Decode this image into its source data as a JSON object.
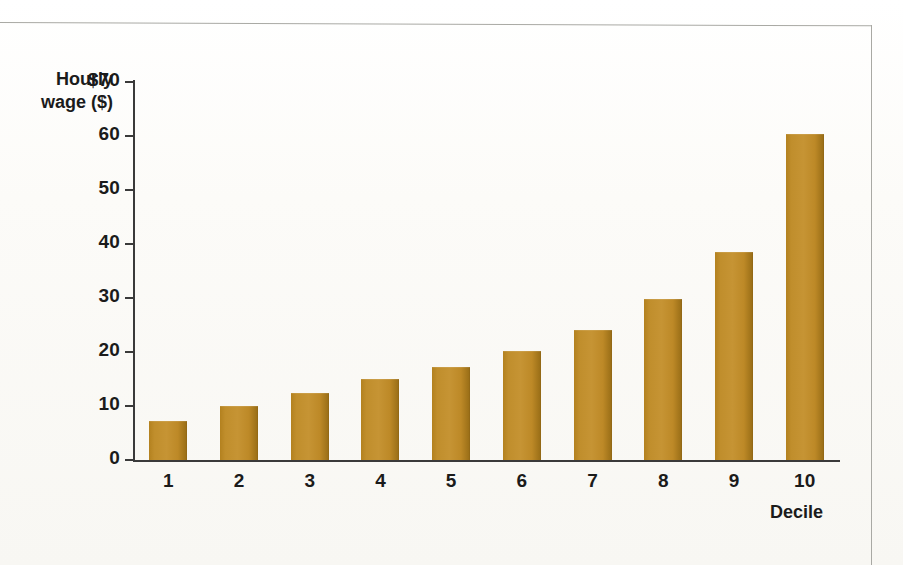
{
  "figure": {
    "background_color": "#fdfdfb",
    "frame_color": "#a9a9a4",
    "axis_color": "#3a3a3a",
    "bar_color": "#c69434",
    "bar_edge_color": "#8c6314"
  },
  "chart_data": {
    "type": "bar",
    "title": "",
    "xlabel": "Decile",
    "ylabel": "Hourly wage ($)",
    "ylabel_line1": "Hourly",
    "ylabel_line2": "wage ($)",
    "categories": [
      "1",
      "2",
      "3",
      "4",
      "5",
      "6",
      "7",
      "8",
      "9",
      "10"
    ],
    "values": [
      7.2,
      10.0,
      12.5,
      15.0,
      17.3,
      20.1,
      24.0,
      29.8,
      38.6,
      60.3
    ],
    "ylim": [
      0,
      70
    ],
    "ytick_values": [
      0,
      10,
      20,
      30,
      40,
      50,
      60,
      70
    ],
    "ytick_labels": [
      "0",
      "10",
      "20",
      "30",
      "40",
      "50",
      "60",
      "$70"
    ],
    "xtick_labels": [
      "1",
      "2",
      "3",
      "4",
      "5",
      "6",
      "7",
      "8",
      "9",
      "10"
    ],
    "grid": false,
    "legend": null,
    "series": [
      {
        "name": "Hourly wage",
        "values": [
          7.2,
          10.0,
          12.5,
          15.0,
          17.3,
          20.1,
          24.0,
          29.8,
          38.6,
          60.3
        ]
      }
    ]
  }
}
